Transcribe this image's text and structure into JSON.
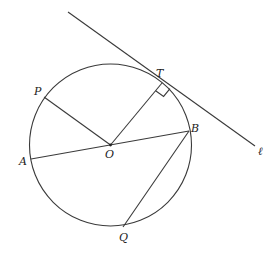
{
  "diagram": {
    "type": "circle-geometry",
    "colors": {
      "stroke": "#3a3a3a",
      "label": "#222222",
      "background": "#ffffff"
    },
    "circle": {
      "center": "O",
      "cx": 110.5,
      "cy": 145,
      "r": 81
    },
    "points": {
      "O": {
        "label": "O",
        "x": 110.5,
        "y": 145
      },
      "T": {
        "label": "T",
        "x": 162,
        "y": 83
      },
      "P": {
        "label": "P",
        "x": 44,
        "y": 97
      },
      "A": {
        "label": "A",
        "x": 31,
        "y": 159
      },
      "B": {
        "label": "B",
        "x": 189,
        "y": 131
      },
      "Q": {
        "label": "Q",
        "x": 123,
        "y": 227
      }
    },
    "tangent_line": {
      "label": "ℓ",
      "through": "T",
      "x1": 68,
      "y1": 12,
      "x2": 255,
      "y2": 146
    },
    "segments": [
      {
        "name": "OP",
        "from": "O",
        "to": "P"
      },
      {
        "name": "OT",
        "from": "O",
        "to": "T"
      },
      {
        "name": "AB",
        "from": "A",
        "to": "B",
        "note": "diameter through O"
      },
      {
        "name": "BQ",
        "from": "B",
        "to": "Q"
      }
    ],
    "annotations": [
      {
        "type": "right-angle",
        "at": "T",
        "between": [
          "OT",
          "ℓ"
        ]
      }
    ]
  }
}
